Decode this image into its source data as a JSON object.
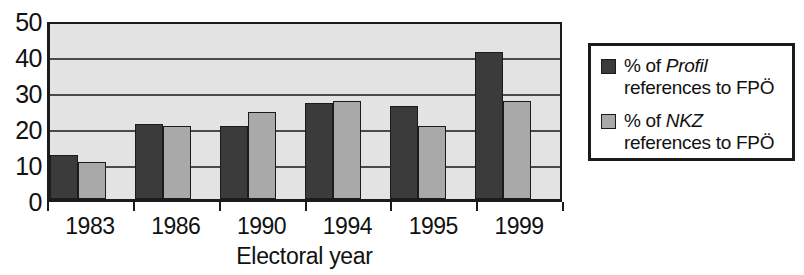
{
  "chart_data": {
    "type": "bar",
    "title": "",
    "subtitle": "",
    "xlabel": "Electoral year",
    "ylabel": "",
    "categories": [
      "1983",
      "1986",
      "1990",
      "1994",
      "1995",
      "1999"
    ],
    "series": [
      {
        "name": "% of Profil references to FPÖ",
        "name_italic_part": "Profil",
        "name_line1": "% of ",
        "name_line2": "references to FPÖ",
        "color": "#3b3b3b",
        "values": [
          12.5,
          21.5,
          21,
          27.5,
          26.5,
          42
        ]
      },
      {
        "name": "% of NKZ references to FPÖ",
        "name_italic_part": "NKZ",
        "name_line1": "% of ",
        "name_line2": "references to FPÖ",
        "color": "#a9a9a9",
        "values": [
          10.5,
          21,
          25,
          28,
          21,
          28
        ]
      }
    ],
    "ylim": [
      0,
      50
    ],
    "yticks": [
      0,
      10,
      20,
      30,
      40,
      50
    ],
    "ytick_labels": [
      "0",
      "10",
      "20",
      "30",
      "40",
      "50"
    ],
    "grid": true,
    "grid_axis": "y",
    "legend_position": "right-outside",
    "plot_background": "#e3e3e3",
    "axis_color": "#1b1b1b",
    "gridline_color": "#4a4a4a"
  }
}
